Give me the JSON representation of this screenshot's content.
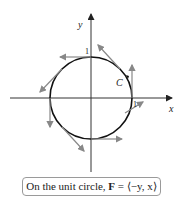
{
  "figure": {
    "axes": {
      "x_label": "x",
      "y_label": "y",
      "tick_x": "1",
      "tick_y": "1"
    },
    "curve_label": "C",
    "caption": {
      "prefix": "On the unit circle, ",
      "bold": "F",
      "suffix": " = ⟨−y, x⟩"
    },
    "colors": {
      "curve": "#111111",
      "vectors": "#888888",
      "axes": "#333333"
    }
  }
}
